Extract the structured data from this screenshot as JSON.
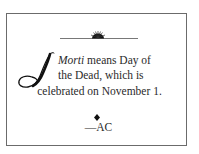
{
  "note": {
    "dropcap_letter": "I",
    "lines": [
      {
        "italic": "Morti",
        "rest": " means Day of"
      },
      {
        "text": "the Dead, which is"
      },
      {
        "text": "celebrated on November 1."
      }
    ],
    "signature": "—AC"
  },
  "ornaments": {
    "top": "sunburst-rule",
    "separator": "diamond"
  },
  "colors": {
    "border": "#6b6b6b",
    "text": "#2a2a2a",
    "ornament": "#111111"
  }
}
